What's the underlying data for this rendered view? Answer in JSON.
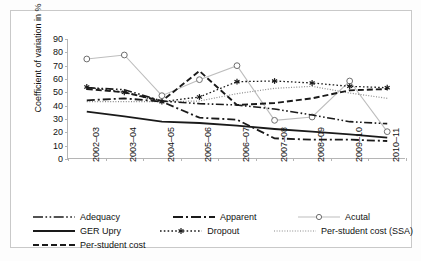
{
  "chart_data": {
    "type": "line",
    "title": "",
    "xlabel": "",
    "ylabel": "Coefficient of variation in %",
    "ylim": [
      0,
      90
    ],
    "ytick_step": 10,
    "yticks": [
      0,
      10,
      20,
      30,
      40,
      50,
      60,
      70,
      80,
      90
    ],
    "grid": false,
    "legend_position": "bottom",
    "categories": [
      "2002–03",
      "2003–04",
      "2004–05",
      "2005–06",
      "2006–07",
      "2007–08",
      "2008–09",
      "2009–10",
      "2010–11"
    ],
    "series": [
      {
        "name": "Adequacy",
        "style": "dash-dot-dot",
        "marker": "none",
        "color": "#1a1a1a",
        "values": [
          53.5,
          52.0,
          43.5,
          41.5,
          40.5,
          37.5,
          33.0,
          28.0,
          26.5
        ]
      },
      {
        "name": "Apparent",
        "style": "dash-dot",
        "marker": "none",
        "color": "#1a1a1a",
        "values": [
          44.0,
          45.5,
          43.0,
          31.0,
          29.5,
          15.5,
          14.5,
          14.5,
          13.5
        ]
      },
      {
        "name": "Acutal",
        "style": "solid-light",
        "marker": "open-circle",
        "color": "#bdbdbd",
        "values": [
          75.0,
          78.0,
          47.5,
          59.5,
          70.0,
          29.0,
          31.5,
          58.5,
          20.5
        ]
      },
      {
        "name": "GER Upry",
        "style": "solid",
        "marker": "none",
        "color": "#1a1a1a",
        "values": [
          35.5,
          32.0,
          28.0,
          27.0,
          25.0,
          22.5,
          20.5,
          18.5,
          16.0
        ]
      },
      {
        "name": "Dropout",
        "style": "dotted-marker",
        "marker": "asterisk",
        "color": "#1a1a1a",
        "values": [
          54.0,
          50.0,
          43.0,
          46.5,
          58.0,
          58.5,
          57.0,
          54.5,
          53.5
        ]
      },
      {
        "name": "Per-student cost (SSA)",
        "style": "fine-dotted",
        "marker": "none",
        "color": "#8a8a8a",
        "values": [
          43.0,
          43.0,
          43.0,
          43.5,
          49.0,
          53.0,
          54.5,
          49.5,
          45.5
        ]
      },
      {
        "name": "Per-student cost",
        "style": "dashed",
        "marker": "none",
        "color": "#1a1a1a",
        "values": [
          52.5,
          50.0,
          43.5,
          66.0,
          40.5,
          42.0,
          45.5,
          51.5,
          52.5
        ]
      }
    ]
  },
  "axis": {
    "y_title": "Coefficient of variation in %"
  },
  "legend": {
    "rows": [
      [
        {
          "label": "Adequacy",
          "key": "dash-dot-dot"
        },
        {
          "label": "Apparent",
          "key": "dash-dot"
        },
        {
          "label": "Acutal",
          "key": "circle-line"
        }
      ],
      [
        {
          "label": "GER Upry",
          "key": "solid"
        },
        {
          "label": "Dropout",
          "key": "asterisk-dotted"
        },
        {
          "label": "Per-student cost (SSA)",
          "key": "fine-dotted"
        }
      ],
      [
        {
          "label": "Per-student cost",
          "key": "dashed"
        }
      ]
    ]
  }
}
